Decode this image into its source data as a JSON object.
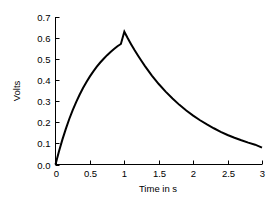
{
  "chart_data": {
    "type": "line",
    "title": "",
    "xlabel": "Time in s",
    "ylabel": "Volts",
    "xlim": [
      0,
      3
    ],
    "ylim": [
      0,
      0.7
    ],
    "grid": false,
    "legend": null,
    "line_color": "#000000",
    "background_color": "#ffffff",
    "xticks": [
      0,
      0.5,
      1,
      1.5,
      2,
      2.5,
      3
    ],
    "xtick_labels": [
      "0",
      "0.5",
      "1",
      "1.5",
      "2",
      "2.5",
      "3"
    ],
    "yticks": [
      0.0,
      0.1,
      0.2,
      0.3,
      0.4,
      0.5,
      0.6,
      0.7
    ],
    "ytick_labels": [
      "0.0",
      "0.1",
      "0.2",
      "0.3",
      "0.4",
      "0.5",
      "0.6",
      "0.7"
    ],
    "annotations": {
      "peak_time": 1,
      "peak_value": 0.63,
      "end_value": 0.08
    },
    "series": [
      {
        "name": "Volts",
        "x": [
          0,
          0.05,
          0.1,
          0.15,
          0.2,
          0.25,
          0.3,
          0.35,
          0.4,
          0.45,
          0.5,
          0.55,
          0.6,
          0.65,
          0.7,
          0.75,
          0.8,
          0.85,
          0.9,
          0.95,
          1.0,
          1.05,
          1.1,
          1.15,
          1.2,
          1.25,
          1.3,
          1.35,
          1.4,
          1.45,
          1.5,
          1.6,
          1.7,
          1.8,
          1.9,
          2.0,
          2.1,
          2.2,
          2.3,
          2.4,
          2.5,
          2.6,
          2.7,
          2.8,
          2.9,
          3.0
        ],
        "values": [
          0.0,
          0.062,
          0.118,
          0.169,
          0.216,
          0.258,
          0.296,
          0.331,
          0.363,
          0.392,
          0.418,
          0.442,
          0.464,
          0.484,
          0.502,
          0.519,
          0.534,
          0.548,
          0.561,
          0.572,
          0.63,
          0.599,
          0.57,
          0.542,
          0.516,
          0.491,
          0.467,
          0.444,
          0.422,
          0.402,
          0.382,
          0.346,
          0.313,
          0.283,
          0.256,
          0.232,
          0.21,
          0.19,
          0.172,
          0.155,
          0.14,
          0.127,
          0.115,
          0.104,
          0.094,
          0.08
        ]
      }
    ]
  },
  "axes": {
    "y_axis_name": "y-axis",
    "x_axis_name": "x-axis"
  }
}
